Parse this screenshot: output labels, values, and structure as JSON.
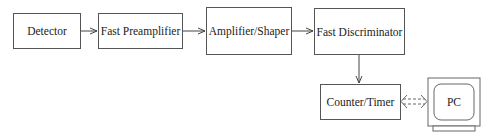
{
  "diagram": {
    "type": "block-diagram",
    "blocks": [
      {
        "id": "detector",
        "label": "Detector"
      },
      {
        "id": "fast-preamplifier",
        "label": "Fast Preamplifier"
      },
      {
        "id": "amplifier-shaper",
        "label": "Amplifier/Shaper"
      },
      {
        "id": "fast-discriminator",
        "label": "Fast Discriminator"
      },
      {
        "id": "counter-timer",
        "label": "Counter/Timer"
      },
      {
        "id": "pc",
        "label": "PC"
      }
    ],
    "connections": [
      {
        "from": "detector",
        "to": "fast-preamplifier",
        "style": "solid"
      },
      {
        "from": "fast-preamplifier",
        "to": "amplifier-shaper",
        "style": "solid"
      },
      {
        "from": "amplifier-shaper",
        "to": "fast-discriminator",
        "style": "solid"
      },
      {
        "from": "fast-discriminator",
        "to": "counter-timer",
        "style": "solid"
      },
      {
        "from": "counter-timer",
        "to": "pc",
        "style": "dashed-bidirectional"
      }
    ]
  }
}
